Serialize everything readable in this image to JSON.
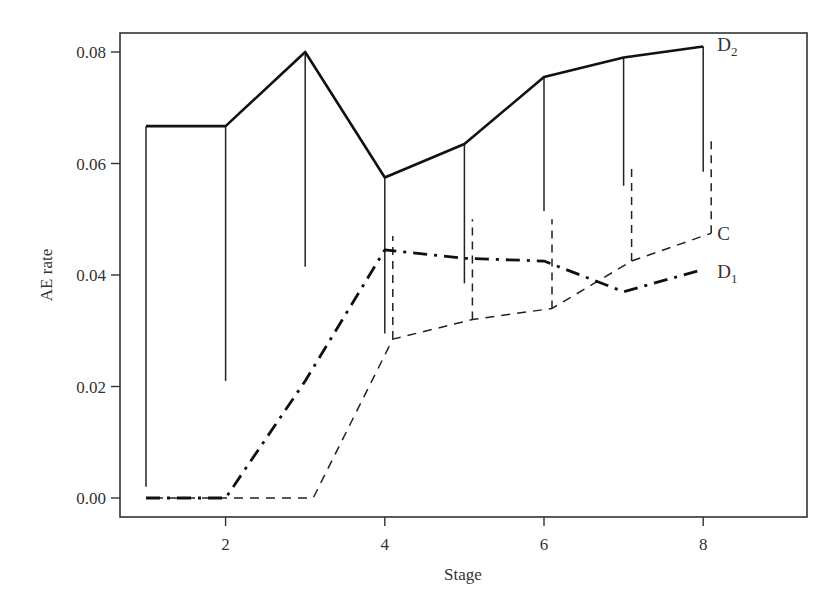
{
  "chart_data": {
    "type": "line",
    "title": "",
    "xlabel": "Stage",
    "ylabel": "AE rate",
    "xlim": [
      0.7,
      9.3
    ],
    "ylim": [
      -0.0035,
      0.0833
    ],
    "x_ticks": [
      2,
      4,
      6,
      8
    ],
    "x_tick_labels": [
      "2",
      "4",
      "6",
      "8"
    ],
    "y_ticks": [
      0.0,
      0.02,
      0.04,
      0.06,
      0.08
    ],
    "y_tick_labels": [
      "0.00",
      "0.02",
      "0.04",
      "0.06",
      "0.08"
    ],
    "grid": false,
    "legend": "direct labels at right end of each series",
    "x": [
      1,
      2,
      3,
      4,
      5,
      6,
      7,
      8
    ],
    "series": [
      {
        "name": "D2",
        "label_main": "D",
        "label_sub": "2",
        "style": "solid-thick",
        "values": [
          0.0667,
          0.0667,
          0.08,
          0.0575,
          0.0635,
          0.0755,
          0.079,
          0.081
        ],
        "interval_lower": [
          0.002,
          0.021,
          0.0415,
          0.0295,
          0.0385,
          0.0515,
          0.056,
          0.0585
        ]
      },
      {
        "name": "C",
        "label_main": "C",
        "label_sub": "",
        "style": "dashed",
        "values": [
          0.0,
          0.0,
          0.0,
          0.0285,
          0.032,
          0.034,
          0.0425,
          0.0475
        ],
        "interval_upper": [
          null,
          null,
          null,
          0.047,
          0.05,
          0.05,
          0.0595,
          0.064
        ]
      },
      {
        "name": "D1",
        "label_main": "D",
        "label_sub": "1",
        "style": "dash-dot-thick",
        "values": [
          0.0,
          0.0,
          0.021,
          0.0445,
          0.043,
          0.0425,
          0.037,
          0.041
        ]
      }
    ]
  }
}
